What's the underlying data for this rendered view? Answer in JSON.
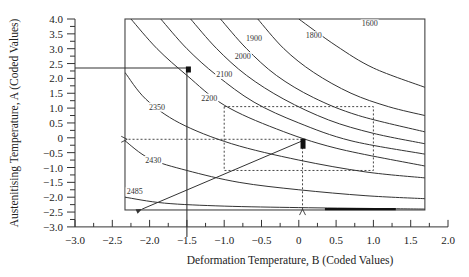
{
  "chart_data": {
    "type": "line",
    "subtype": "contour",
    "title": "",
    "xlabel": "Deformation Temperature, B (Coded Values)",
    "ylabel": "Austenitising Temperature, A (Coded Values)",
    "xlim": [
      -3.0,
      2.0
    ],
    "ylim": [
      -3.0,
      4.0
    ],
    "x_ticks": [
      "-3.0",
      "-2.5",
      "-2.0",
      "-1.5",
      "-1.0",
      "-0.5",
      "0",
      "0.5",
      "1.0",
      "1.5",
      "2.0"
    ],
    "y_ticks": [
      "4.0",
      "3.5",
      "3.0",
      "2.5",
      "2.0",
      "1.5",
      "1.0",
      "0.5",
      "0",
      "-0.5",
      "-1.0",
      "-1.5",
      "-2.0",
      "-2.5",
      "-3.0"
    ],
    "grid": false,
    "legend": null,
    "plot_box": {
      "x": [
        -2.33,
        1.69
      ],
      "y": [
        -2.43,
        4.0
      ]
    },
    "contours": [
      {
        "level": "1600",
        "label_pos": [
          0.95,
          3.75
        ],
        "points": [
          [
            0.0,
            4.0
          ],
          [
            0.5,
            3.1
          ],
          [
            1.0,
            2.35
          ],
          [
            1.69,
            1.7
          ]
        ]
      },
      {
        "level": "1800",
        "label_pos": [
          0.2,
          3.35
        ],
        "points": [
          [
            -0.55,
            4.0
          ],
          [
            -0.2,
            3.0
          ],
          [
            0.2,
            2.2
          ],
          [
            0.7,
            1.5
          ],
          [
            1.2,
            1.05
          ],
          [
            1.69,
            0.75
          ]
        ]
      },
      {
        "level": "1900",
        "label_pos": [
          -0.6,
          3.25
        ],
        "points": [
          [
            -1.05,
            4.0
          ],
          [
            -0.7,
            3.0
          ],
          [
            -0.3,
            2.1
          ],
          [
            0.2,
            1.35
          ],
          [
            0.8,
            0.75
          ],
          [
            1.69,
            0.2
          ]
        ]
      },
      {
        "level": "2000",
        "label_pos": [
          -0.75,
          2.65
        ],
        "points": [
          [
            -1.45,
            4.0
          ],
          [
            -1.1,
            3.0
          ],
          [
            -0.7,
            2.1
          ],
          [
            -0.2,
            1.3
          ],
          [
            0.4,
            0.6
          ],
          [
            1.0,
            0.15
          ],
          [
            1.69,
            -0.2
          ]
        ]
      },
      {
        "level": "2100",
        "label_pos": [
          -1.0,
          2.05
        ],
        "points": [
          [
            -1.85,
            4.0
          ],
          [
            -1.5,
            3.0
          ],
          [
            -1.1,
            2.1
          ],
          [
            -0.6,
            1.2
          ],
          [
            0.0,
            0.5
          ],
          [
            0.7,
            -0.1
          ],
          [
            1.69,
            -0.55
          ]
        ]
      },
      {
        "level": "2200",
        "label_pos": [
          -1.2,
          1.25
        ],
        "points": [
          [
            -2.25,
            4.0
          ],
          [
            -1.9,
            3.0
          ],
          [
            -1.5,
            2.1
          ],
          [
            -1.0,
            1.1
          ],
          [
            -0.3,
            0.3
          ],
          [
            0.5,
            -0.35
          ],
          [
            1.69,
            -0.95
          ]
        ]
      },
      {
        "level": "2350",
        "label_pos": [
          -1.9,
          0.95
        ],
        "points": [
          [
            -2.33,
            2.2
          ],
          [
            -2.05,
            1.3
          ],
          [
            -1.6,
            0.5
          ],
          [
            -0.9,
            -0.2
          ],
          [
            0.0,
            -0.75
          ],
          [
            0.9,
            -1.15
          ],
          [
            1.69,
            -1.35
          ]
        ]
      },
      {
        "level": "2430",
        "label_pos": [
          -1.95,
          -0.85
        ],
        "points": [
          [
            -2.33,
            -0.1
          ],
          [
            -2.0,
            -0.7
          ],
          [
            -1.5,
            -1.1
          ],
          [
            -0.8,
            -1.5
          ],
          [
            0.0,
            -1.75
          ],
          [
            0.9,
            -1.95
          ],
          [
            1.69,
            -2.05
          ]
        ]
      },
      {
        "level": "2485",
        "label_pos": [
          -2.2,
          -1.9
        ],
        "points": [
          [
            -2.33,
            -2.0
          ],
          [
            -1.8,
            -2.2
          ],
          [
            -1.0,
            -2.3
          ],
          [
            0.0,
            -2.35
          ],
          [
            1.0,
            -2.38
          ],
          [
            1.69,
            -2.4
          ]
        ]
      }
    ],
    "annotations": {
      "optimum_point_1": {
        "x": -1.5,
        "y": 2.3,
        "marker": "filled-square"
      },
      "optimum_point_2": {
        "x": 0.05,
        "y": -0.2,
        "marker": "filled-rect"
      },
      "guide_lines_solid": [
        [
          [
            -3.0,
            2.35
          ],
          [
            -1.5,
            2.35
          ]
        ],
        [
          [
            -1.5,
            2.35
          ],
          [
            -1.5,
            -3.0
          ]
        ]
      ],
      "dashed_box": {
        "x": [
          -1.0,
          1.0
        ],
        "y": [
          -1.1,
          1.05
        ]
      },
      "dashed_arrows": [
        {
          "from": [
            0.05,
            -0.05
          ],
          "to": [
            -2.3,
            -0.05
          ]
        },
        {
          "from": [
            0.05,
            -0.05
          ],
          "to": [
            0.05,
            -2.4
          ]
        }
      ],
      "solid_arrows": [
        {
          "from": [
            0.05,
            -0.1
          ],
          "to": [
            -2.1,
            -2.4
          ]
        }
      ],
      "thick_segment": {
        "x": [
          0.35,
          1.3
        ],
        "y": -2.4
      }
    }
  }
}
